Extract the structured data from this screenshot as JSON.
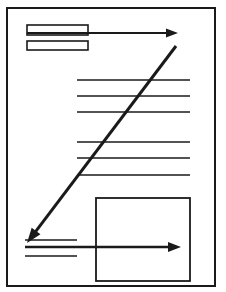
{
  "figure": {
    "type": "line-diagram",
    "background_color": "#ffffff",
    "stroke_color": "#1a1a1a",
    "canvas": {
      "width": 226,
      "height": 292
    }
  },
  "page_frame": {
    "name": "document-page-border",
    "x": 7,
    "y": 8,
    "width": 208,
    "height": 278,
    "stroke_width": 2
  },
  "header_fields": [
    {
      "label": "header-field-upper",
      "x": 27,
      "y": 25,
      "width": 61,
      "height": 10,
      "stroke_width": 1.6
    },
    {
      "label": "header-field-lower",
      "x": 27,
      "y": 41,
      "width": 61,
      "height": 9,
      "stroke_width": 1.6
    }
  ],
  "text_lines": {
    "name": "body-text-rules",
    "x_start": 77,
    "x_end": 190,
    "stroke_width": 1.4,
    "y_positions": [
      80,
      96,
      112,
      142,
      158,
      175
    ]
  },
  "footer_lines": {
    "name": "footer-text-rules",
    "x_start": 25,
    "x_end": 77,
    "stroke_width": 1.4,
    "y_positions": [
      240,
      256
    ]
  },
  "content_box": {
    "name": "bottom-right-content-box",
    "x": 96,
    "y": 198,
    "width": 94,
    "height": 83,
    "stroke_width": 1.8
  },
  "arrows": [
    {
      "name": "top-horizontal-arrow",
      "direction": "right",
      "x1": 27,
      "y1": 33,
      "x2": 178,
      "y2": 33,
      "stroke_width": 2.2,
      "head_length": 12,
      "head_width": 9
    },
    {
      "name": "diagonal-callout-arrow",
      "direction": "down-left",
      "x1": 176,
      "y1": 46,
      "x2": 27,
      "y2": 243,
      "stroke_width": 3,
      "head_length": 15,
      "head_width": 11
    },
    {
      "name": "bottom-horizontal-arrow",
      "direction": "right",
      "x1": 25,
      "y1": 247,
      "x2": 181,
      "y2": 247,
      "stroke_width": 2.6,
      "head_length": 13,
      "head_width": 10
    }
  ],
  "legend": {
    "caption": "Schematic document page: two header fields and six body text rules at top, a framed content box at lower right, with three pointer arrows indicating flow from the header across the page and diagonally down to the footer region."
  }
}
